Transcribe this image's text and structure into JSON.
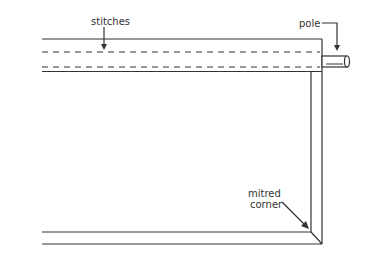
{
  "diagram": {
    "labels": {
      "stitches": "stitches",
      "pole": "pole",
      "mitred_line1": "mitred",
      "mitred_line2": "corner"
    },
    "colors": {
      "line": "#333333",
      "background": "#ffffff"
    }
  }
}
